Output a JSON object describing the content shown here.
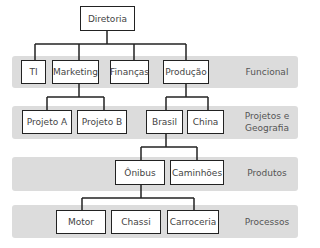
{
  "diagram": {
    "root": "Diretoria",
    "levels": [
      {
        "label": "Funcional",
        "nodes": [
          "TI",
          "Marketing",
          "Finanças",
          "Produção"
        ]
      },
      {
        "label": "Projetos e Geografia",
        "label_lines": [
          "Projetos e",
          "Geografia"
        ],
        "nodes": [
          "Projeto A",
          "Projeto B",
          "Brasil",
          "China"
        ]
      },
      {
        "label": "Produtos",
        "nodes": [
          "Ônibus",
          "Caminhões"
        ]
      },
      {
        "label": "Processos",
        "nodes": [
          "Motor",
          "Chassi",
          "Carroceria"
        ]
      }
    ],
    "edges": [
      [
        "Diretoria",
        "TI"
      ],
      [
        "Diretoria",
        "Marketing"
      ],
      [
        "Diretoria",
        "Finanças"
      ],
      [
        "Diretoria",
        "Produção"
      ],
      [
        "Marketing",
        "Projeto A"
      ],
      [
        "Marketing",
        "Projeto B"
      ],
      [
        "Produção",
        "Brasil"
      ],
      [
        "Produção",
        "China"
      ],
      [
        "Brasil",
        "Ônibus"
      ],
      [
        "Brasil",
        "Caminhões"
      ],
      [
        "Ônibus",
        "Motor"
      ],
      [
        "Ônibus",
        "Chassi"
      ],
      [
        "Ônibus",
        "Carroceria"
      ]
    ],
    "colors": {
      "band": "#dcdcdc",
      "box_border": "#222222",
      "line": "#222222"
    }
  }
}
